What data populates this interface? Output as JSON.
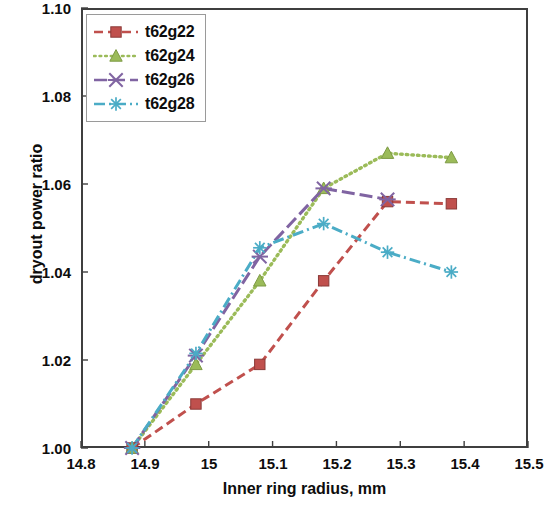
{
  "chart_data": {
    "type": "line",
    "title": "",
    "xlabel": "Inner ring radius, mm",
    "ylabel": "dryout power ratio",
    "xlim": [
      14.8,
      15.5
    ],
    "ylim": [
      1.0,
      1.1
    ],
    "xticks": [
      "14.8",
      "14.9",
      "15",
      "15.1",
      "15.2",
      "15.3",
      "15.4",
      "15.5"
    ],
    "xtick_values": [
      14.8,
      14.9,
      15.0,
      15.1,
      15.2,
      15.3,
      15.4,
      15.5
    ],
    "yticks": [
      "1.00",
      "1.02",
      "1.04",
      "1.06",
      "1.08",
      "1.10"
    ],
    "ytick_values": [
      1.0,
      1.02,
      1.04,
      1.06,
      1.08,
      1.1
    ],
    "grid": false,
    "legend_position": "top-left",
    "series": [
      {
        "name": "t62g22",
        "color": "#C0504D",
        "marker": "square",
        "dash": "dashed",
        "x": [
          14.88,
          14.98,
          15.08,
          15.18,
          15.28,
          15.38
        ],
        "y": [
          1.0,
          1.01,
          1.019,
          1.038,
          1.056,
          1.0555
        ]
      },
      {
        "name": "t62g24",
        "color": "#9BBB59",
        "marker": "triangle",
        "dash": "dotted",
        "x": [
          14.88,
          14.98,
          15.08,
          15.18,
          15.28,
          15.38
        ],
        "y": [
          1.0,
          1.019,
          1.038,
          1.059,
          1.067,
          1.066
        ]
      },
      {
        "name": "t62g26",
        "color": "#8064A2",
        "marker": "x",
        "dash": "long-dash",
        "x": [
          14.88,
          14.98,
          15.08,
          15.18,
          15.28
        ],
        "y": [
          1.0,
          1.021,
          1.0435,
          1.059,
          1.0565
        ]
      },
      {
        "name": "t62g28",
        "color": "#4BACC6",
        "marker": "asterisk",
        "dash": "dash-dot",
        "x": [
          14.88,
          14.98,
          15.08,
          15.18,
          15.28,
          15.38
        ],
        "y": [
          1.0,
          1.0215,
          1.0455,
          1.051,
          1.0445,
          1.04
        ]
      }
    ]
  },
  "axes": {
    "y_title": "dryout power ratio",
    "x_title": "Inner ring radius, mm",
    "y_labels": [
      "1.10",
      "1.08",
      "1.06",
      "1.04",
      "1.02",
      "1.00"
    ],
    "x_labels": [
      "14.8",
      "14.9",
      "15",
      "15.1",
      "15.2",
      "15.3",
      "15.4",
      "15.5"
    ]
  },
  "legend": {
    "items": [
      {
        "label": "t62g22",
        "color": "#C0504D"
      },
      {
        "label": "t62g24",
        "color": "#9BBB59"
      },
      {
        "label": "t62g26",
        "color": "#8064A2"
      },
      {
        "label": "t62g28",
        "color": "#4BACC6"
      }
    ]
  }
}
